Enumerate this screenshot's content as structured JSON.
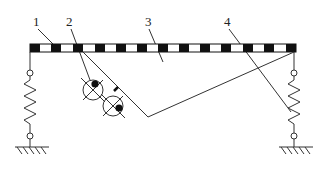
{
  "diagram": {
    "type": "vibration-machine-schematic",
    "labels": [
      {
        "id": "1",
        "text": "1",
        "x": 36,
        "y": 26,
        "target": "beam"
      },
      {
        "id": "2",
        "text": "2",
        "x": 69,
        "y": 26,
        "target": "exciter"
      },
      {
        "id": "3",
        "text": "3",
        "x": 148,
        "y": 26,
        "target": "frame"
      },
      {
        "id": "4",
        "text": "4",
        "x": 227,
        "y": 26,
        "target": "spring"
      }
    ],
    "colors": {
      "line": "#333333",
      "fill_dark": "#111111",
      "background": "#ffffff"
    },
    "components": {
      "beam": {
        "x1": 30,
        "x2": 296,
        "y": 44,
        "height": 8,
        "segments": 16
      },
      "frame_v": {
        "left": [
          75,
          52
        ],
        "bottom": [
          148,
          117
        ],
        "right": [
          294,
          52
        ]
      },
      "exciters": [
        {
          "cx": 93,
          "cy": 90,
          "r": 10
        },
        {
          "cx": 113,
          "cy": 106,
          "r": 10
        }
      ],
      "supports": [
        {
          "side": "left",
          "x": 30
        },
        {
          "side": "right",
          "x": 294
        }
      ]
    }
  }
}
